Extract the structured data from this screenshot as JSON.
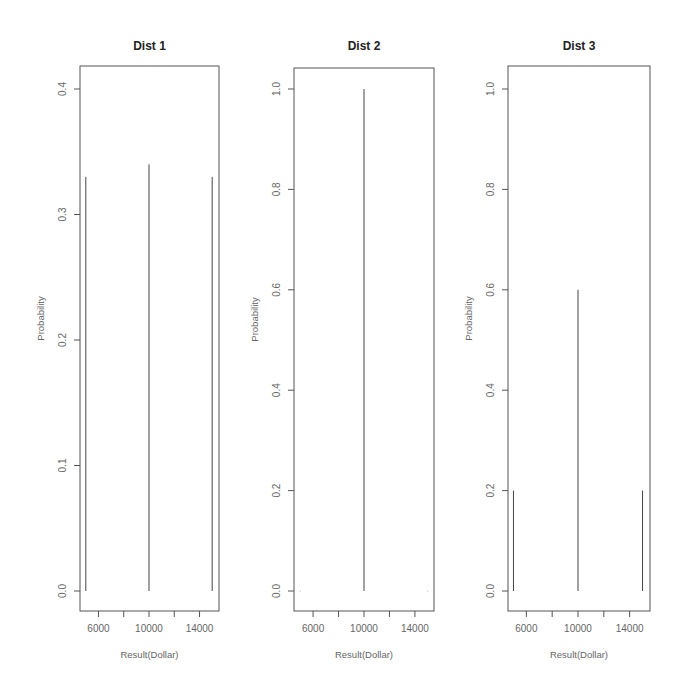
{
  "chart_data": [
    {
      "type": "bar",
      "subtype": "probability-mass spikes (type='h')",
      "title": "Dist 1",
      "xlabel": "Result(Dollar)",
      "ylabel": "Probability",
      "x": [
        5000,
        10000,
        15000
      ],
      "values": [
        0.33,
        0.34,
        0.33
      ],
      "xlim": [
        4400,
        15600
      ],
      "ylim": [
        -0.016,
        0.416
      ],
      "xticks": [
        6000,
        8000,
        10000,
        12000,
        14000
      ],
      "xtick_labels": [
        "6000",
        "",
        "10000",
        "",
        "14000"
      ],
      "yticks": [
        0.0,
        0.1,
        0.2,
        0.3,
        0.4
      ],
      "ytick_labels": [
        "0.0",
        "0.1",
        "0.2",
        "0.3",
        "0.4"
      ],
      "grid": false
    },
    {
      "type": "bar",
      "subtype": "probability-mass spikes (type='h')",
      "title": "Dist 2",
      "xlabel": "Result(Dollar)",
      "ylabel": "Probability",
      "x": [
        5000,
        10000,
        15000
      ],
      "values": [
        0.0,
        1.0,
        0.0
      ],
      "xlim": [
        4400,
        15600
      ],
      "ylim": [
        -0.04,
        1.04
      ],
      "xticks": [
        6000,
        8000,
        10000,
        12000,
        14000
      ],
      "xtick_labels": [
        "6000",
        "",
        "10000",
        "",
        "14000"
      ],
      "yticks": [
        0.0,
        0.2,
        0.4,
        0.6,
        0.8,
        1.0
      ],
      "ytick_labels": [
        "0.0",
        "0.2",
        "0.4",
        "0.6",
        "0.8",
        "1.0"
      ],
      "grid": false
    },
    {
      "type": "bar",
      "subtype": "probability-mass spikes (type='h')",
      "title": "Dist 3",
      "xlabel": "Result(Dollar)",
      "ylabel": "Probability",
      "x": [
        5000,
        10000,
        15000
      ],
      "values": [
        0.2,
        0.6,
        0.2
      ],
      "xlim": [
        4400,
        15600
      ],
      "ylim": [
        -0.04,
        1.04
      ],
      "xticks": [
        6000,
        8000,
        10000,
        12000,
        14000
      ],
      "xtick_labels": [
        "6000",
        "",
        "10000",
        "",
        "14000"
      ],
      "yticks": [
        0.0,
        0.2,
        0.4,
        0.6,
        0.8,
        1.0
      ],
      "ytick_labels": [
        "0.0",
        "0.2",
        "0.4",
        "0.6",
        "0.8",
        "1.0"
      ],
      "grid": false
    }
  ],
  "layout": {
    "panels": [
      {
        "left": 80,
        "right": 219,
        "top": 66,
        "bottom": 611,
        "y0px": 591,
        "ytop_val": 0.4,
        "ytop_px": 89
      },
      {
        "left": 294,
        "right": 434,
        "top": 68,
        "bottom": 611,
        "y0px": 591,
        "ytop_val": 1.0,
        "ytop_px": 89
      },
      {
        "left": 508,
        "right": 650,
        "top": 66,
        "bottom": 611,
        "y0px": 591,
        "ytop_val": 1.0,
        "ytop_px": 89
      }
    ],
    "colors": {
      "frame": "#555555",
      "spike": "#444444",
      "title": "#222222",
      "tick_label": "#666666"
    }
  }
}
